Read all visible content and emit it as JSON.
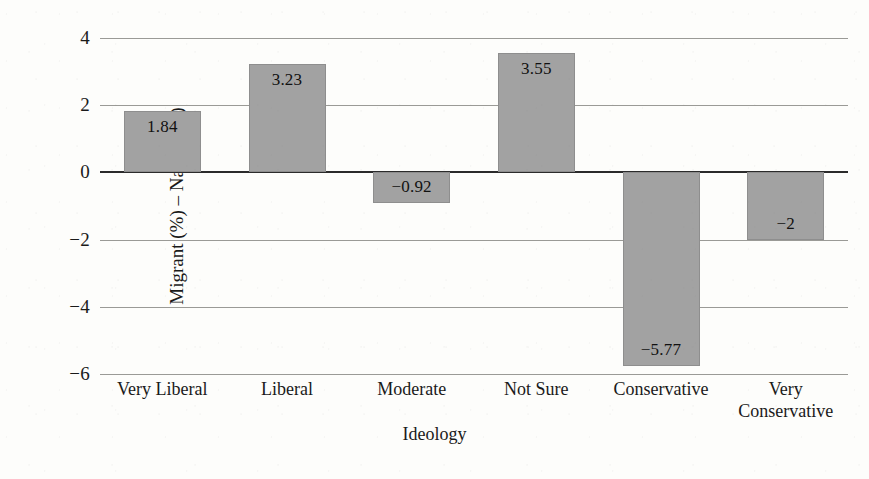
{
  "chart_data": {
    "type": "bar",
    "title": "",
    "xlabel": "Ideology",
    "ylabel": "Migrant (%) – Native (%)",
    "categories": [
      "Very Liberal",
      "Liberal",
      "Moderate",
      "Not Sure",
      "Conservative",
      "Very Conservative"
    ],
    "values": [
      1.84,
      3.23,
      -0.92,
      3.55,
      -5.77,
      -2
    ],
    "value_labels": [
      "1.84",
      "3.23",
      "−0.92",
      "3.55",
      "−5.77",
      "−2"
    ],
    "ylim": [
      -6,
      4
    ],
    "yticks": [
      4,
      2,
      0,
      -2,
      -4,
      -6
    ],
    "ytick_labels": [
      "4",
      "2",
      "0",
      "−2",
      "−4",
      "−6"
    ],
    "grid": true,
    "legend": "none",
    "series_name": "Migrant minus Native percentage",
    "bar_color": "#a2a2a2",
    "gridline_color": "#9a9a96",
    "zeroline_color": "#2b2b2b",
    "background_color": "#fdfdfb"
  }
}
